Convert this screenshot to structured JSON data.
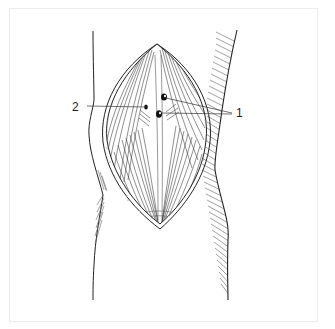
{
  "figure": {
    "labels": [
      {
        "id": "1",
        "text": "1",
        "x": 236,
        "y": 107
      },
      {
        "id": "2",
        "text": "2",
        "x": 72,
        "y": 101
      }
    ],
    "colors": {
      "ink": "#222222",
      "hatch": "#555555",
      "frame": "#ececec",
      "background": "#ffffff"
    }
  }
}
